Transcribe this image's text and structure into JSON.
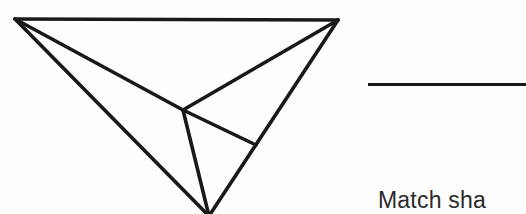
{
  "page": {
    "width": 526,
    "height": 214,
    "background_color": "#fdfdfd",
    "ink_color": "#191919",
    "text_color": "#2a2a2a"
  },
  "figure": {
    "name": "wireframe-polyhedron",
    "stroke_color": "#191919",
    "stroke_width": 3.6,
    "vertices": {
      "top_left": [
        15,
        19
      ],
      "top_right": [
        338,
        20
      ],
      "bottom": [
        209,
        214
      ],
      "interior": [
        183,
        110
      ],
      "right_mid": [
        256,
        145
      ]
    },
    "edges": [
      {
        "name": "top-edge",
        "from": "top_left",
        "to": "top_right"
      },
      {
        "name": "left-edge",
        "from": "top_left",
        "to": "bottom"
      },
      {
        "name": "right-edge",
        "from": "top_right",
        "to": "bottom"
      },
      {
        "name": "top-left-to-interior",
        "from": "top_left",
        "to": "interior"
      },
      {
        "name": "top-right-to-interior",
        "from": "top_right",
        "to": "interior"
      },
      {
        "name": "interior-to-bottom",
        "from": "interior",
        "to": "bottom"
      },
      {
        "name": "interior-to-right-mid",
        "from": "interior",
        "to": "right_mid"
      }
    ]
  },
  "rule": {
    "label": "horizontal-rule",
    "thickness_px": 3
  },
  "caption": {
    "text": "Match sha",
    "note_cropped": true
  }
}
